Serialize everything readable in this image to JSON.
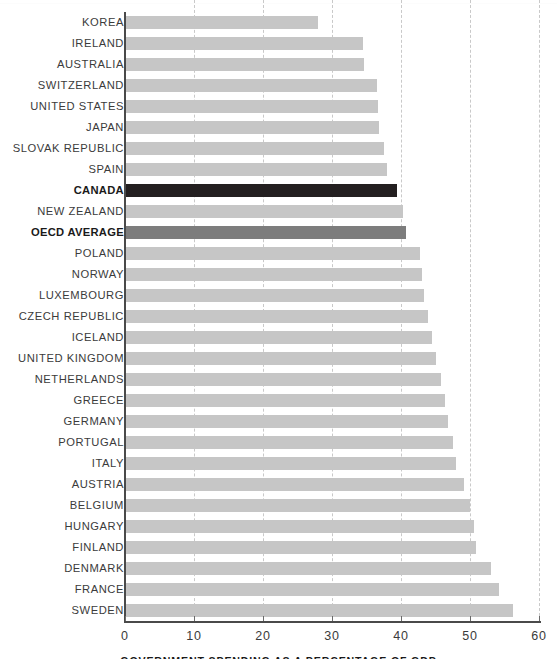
{
  "chart_data": {
    "type": "bar",
    "orientation": "horizontal",
    "title": "",
    "xlabel": "GOVERNMENT SPENDING AS A PERCENTAGE OF GDP",
    "ylabel": "",
    "xlim": [
      0,
      60
    ],
    "xticks": [
      0,
      10,
      20,
      30,
      40,
      50,
      60
    ],
    "xtick_labels": [
      "0",
      "10",
      "20",
      "30",
      "40",
      "50",
      "60"
    ],
    "grid": "vertical-dashed",
    "legend": "none",
    "categories": [
      "KOREA",
      "IRELAND",
      "AUSTRALIA",
      "SWITZERLAND",
      "UNITED STATES",
      "JAPAN",
      "SLOVAK REPUBLIC",
      "SPAIN",
      "CANADA",
      "NEW ZEALAND",
      "OECD AVERAGE",
      "POLAND",
      "NORWAY",
      "LUXEMBOURG",
      "CZECH REPUBLIC",
      "ICELAND",
      "UNITED KINGDOM",
      "NETHERLANDS",
      "GREECE",
      "GERMANY",
      "PORTUGAL",
      "ITALY",
      "AUSTRIA",
      "BELGIUM",
      "HUNGARY",
      "FINLAND",
      "DENMARK",
      "FRANCE",
      "SWEDEN"
    ],
    "values": [
      28.0,
      34.5,
      34.7,
      36.5,
      36.6,
      36.8,
      37.5,
      38.0,
      39.4,
      40.3,
      40.7,
      42.8,
      43.0,
      43.3,
      43.9,
      44.5,
      45.0,
      45.8,
      46.4,
      46.8,
      47.6,
      48.0,
      49.2,
      50.0,
      50.6,
      50.8,
      53.0,
      54.2,
      56.2
    ],
    "highlights": {
      "CANADA": "canada",
      "OECD AVERAGE": "oecd"
    }
  },
  "colors": {
    "bar_default": "#c6c6c6",
    "bar_canada": "#231f20",
    "bar_oecd": "#7d7d7d",
    "axis": "#4a4a4a",
    "gridline": "#c9c9c9",
    "label_text": "#3b3b3b",
    "background": "#ffffff"
  }
}
